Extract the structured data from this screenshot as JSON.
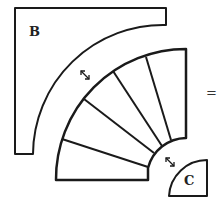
{
  "diagram": {
    "labels": {
      "piece_b": "B",
      "piece_c": "C",
      "equals": "="
    },
    "pieces": [
      {
        "id": "B",
        "shape": "square-with-quarter-circle-cutout"
      },
      {
        "id": "fan",
        "shape": "annular-sector-divided",
        "segments": 5
      },
      {
        "id": "C",
        "shape": "quarter-circle"
      }
    ],
    "icons": [
      "resize-diagonal-icon",
      "resize-diagonal-icon"
    ],
    "colors": {
      "stroke": "#1a1a1a",
      "background": "#ffffff"
    }
  }
}
